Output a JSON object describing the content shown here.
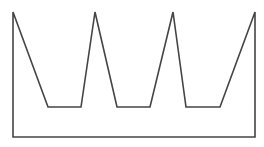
{
  "diagram": {
    "shape": "crown-outline",
    "stroke_color": "#444444",
    "stroke_width": 1.6,
    "fill": "none",
    "background": "#ffffff",
    "vertices": [
      [
        13,
        12
      ],
      [
        48,
        107
      ],
      [
        81,
        107
      ],
      [
        95,
        12
      ],
      [
        117,
        107
      ],
      [
        150,
        107
      ],
      [
        173,
        12
      ],
      [
        186,
        107
      ],
      [
        220,
        107
      ],
      [
        255,
        12
      ],
      [
        255,
        137
      ],
      [
        13,
        137
      ]
    ]
  }
}
